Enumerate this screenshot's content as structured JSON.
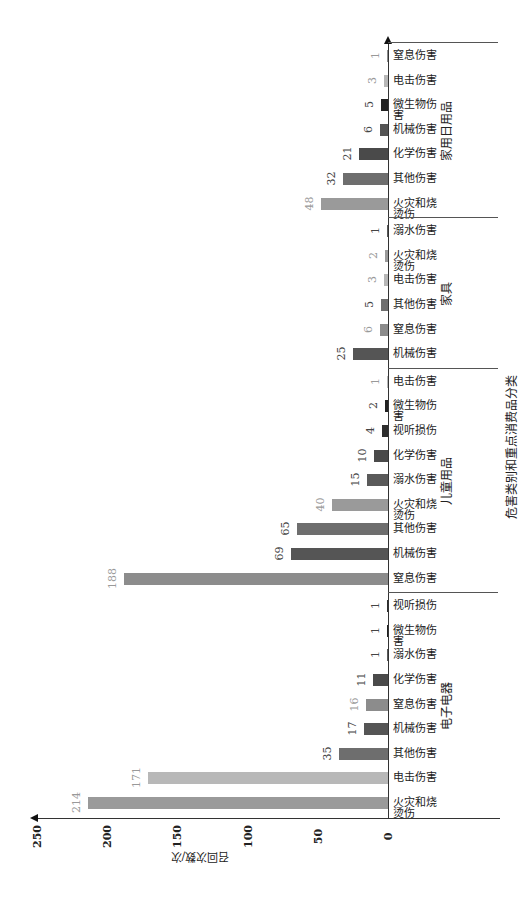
{
  "chart_data": {
    "type": "bar",
    "orientation": "rotated-90-ccw",
    "title": "危害类别和重点消费品分类",
    "xlabel": "危害类别和重点消费品分类",
    "ylabel": "召回次数/次",
    "ylim": [
      0,
      250
    ],
    "yticks": [
      "0",
      "50",
      "100",
      "150",
      "200",
      "250"
    ],
    "grid": false,
    "groups": [
      {
        "name": "电子电器",
        "categories": [
          "火灾和烧烫伤",
          "电击伤害",
          "其他伤害",
          "机械伤害",
          "窒息伤害",
          "化学伤害",
          "溺水伤害",
          "微生物伤害",
          "视听损伤"
        ],
        "values": [
          214,
          171,
          35,
          17,
          16,
          11,
          1,
          1,
          1
        ]
      },
      {
        "name": "儿童用品",
        "categories": [
          "窒息伤害",
          "机械伤害",
          "其他伤害",
          "火灾和烧烫伤",
          "溺水伤害",
          "化学伤害",
          "视听损伤",
          "微生物伤害",
          "电击伤害"
        ],
        "values": [
          188,
          69,
          65,
          40,
          15,
          10,
          4,
          2,
          1
        ]
      },
      {
        "name": "家具",
        "categories": [
          "机械伤害",
          "窒息伤害",
          "其他伤害",
          "电击伤害",
          "火灾和烧烫伤",
          "溺水伤害"
        ],
        "values": [
          25,
          6,
          5,
          3,
          2,
          1
        ]
      },
      {
        "name": "家用日用品",
        "categories": [
          "火灾和烧烫伤",
          "其他伤害",
          "化学伤害",
          "机械伤害",
          "微生物伤害",
          "电击伤害",
          "窒息伤害"
        ],
        "values": [
          48,
          32,
          21,
          6,
          5,
          3,
          1
        ]
      }
    ],
    "hazard_colors": {
      "火灾和烧烫伤": "#9a9a9a",
      "电击伤害": "#b8b8b8",
      "其他伤害": "#6e6e6e",
      "机械伤害": "#555555",
      "窒息伤害": "#8c8c8c",
      "化学伤害": "#4a4a4a",
      "溺水伤害": "#5a5a5a",
      "微生物伤害": "#222222",
      "视听损伤": "#2e2e2e"
    }
  },
  "labels": {
    "title": "危害类别和重点消费品分类",
    "ylabel": "召回次数/次",
    "ticks": [
      "0",
      "50",
      "100",
      "150",
      "200",
      "250"
    ]
  }
}
